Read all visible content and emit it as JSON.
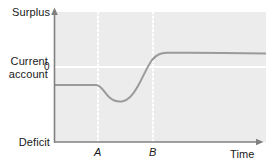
{
  "chart_data": {
    "type": "line",
    "title": "",
    "subtitle": "",
    "xlabel": "Time",
    "ylabel": "Current account",
    "y_axis_top_label": "Surplus",
    "y_axis_bottom_label": "Deficit",
    "y_tick_labels": [
      "0"
    ],
    "x_tick_labels": [
      "A",
      "B"
    ],
    "grid": false,
    "legend": null,
    "annotations": [
      {
        "name": "zero-line",
        "kind": "horizontal-reference-line",
        "value": 0,
        "color": "#ffffff"
      },
      {
        "name": "event-line-a",
        "kind": "vertical-dotted-line",
        "x": "A",
        "color": "#ffffff"
      },
      {
        "name": "event-line-b",
        "kind": "vertical-dotted-line",
        "x": "B",
        "color": "#ffffff"
      }
    ],
    "xlim": [
      0,
      100
    ],
    "ylim": [
      -100,
      100
    ],
    "x_tick_values": [
      21,
      47
    ],
    "series": [
      {
        "name": "Current account balance",
        "color": "#9a9a9a",
        "x": [
          0,
          8,
          16,
          21,
          25,
          29,
          32,
          36,
          40,
          44,
          47,
          51,
          55,
          60,
          66,
          73,
          82,
          92,
          100
        ],
        "values": [
          -27,
          -27,
          -27,
          -27,
          -35,
          -43,
          -49,
          -51,
          -47,
          -36,
          -20,
          -2,
          12,
          20,
          23,
          24,
          24,
          24,
          24
        ]
      }
    ]
  },
  "chart_colors": {
    "plot_background": "#ececec",
    "page_background": "#ffffff",
    "axis": "#808080",
    "curve": "#9a9a9a",
    "reference_line": "#ffffff",
    "text": "#1a1a1a"
  }
}
